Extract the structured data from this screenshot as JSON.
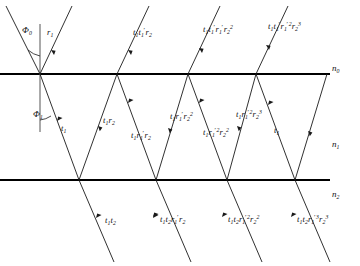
{
  "figure": {
    "width": 360,
    "height": 266,
    "background_color": "#ffffff",
    "line_color": "#1a1a1a",
    "interface_color": "#000000"
  },
  "angles": [
    {
      "name": "phi-0",
      "label_html": "&Phi;<sub>0</sub>",
      "text": "Φ₀",
      "x": 22,
      "y": 26,
      "meaning": "angle of incidence in medium n0"
    },
    {
      "name": "phi-1",
      "label_html": "&Phi;<sub>1</sub>",
      "text": "Φ₁",
      "x": 33,
      "y": 110,
      "meaning": "refraction angle in medium n1"
    }
  ],
  "media": [
    {
      "name": "n-0",
      "label_html": "n<sub>0</sub>",
      "text": "n₀",
      "x": 332,
      "y": 64,
      "meaning": "refractive index of upper medium"
    },
    {
      "name": "n-1",
      "label_html": "n<sub>1</sub>",
      "text": "n₁",
      "x": 332,
      "y": 140,
      "meaning": "refractive index of film"
    },
    {
      "name": "n-2",
      "label_html": "n<sub>2</sub>",
      "text": "n₂",
      "x": 332,
      "y": 190,
      "meaning": "refractive index of lower medium"
    }
  ],
  "interfaces": [
    {
      "name": "top-interface",
      "y": 74,
      "x1": 0,
      "x2": 330
    },
    {
      "name": "bottom-interface",
      "y": 180,
      "x1": 0,
      "x2": 330
    }
  ],
  "reflected_beams": [
    {
      "name": "reflected-beam-1",
      "label_html": "r<sub>1</sub>",
      "text": "r₁",
      "x": 47,
      "y": 28
    },
    {
      "name": "reflected-beam-2",
      "label_html": "t<sub>1</sub>t<sub>1</sub><span class=\"pr\">′</span>r<sub>2</sub>",
      "text": "t₁t₁′r₂",
      "x": 133,
      "y": 28
    },
    {
      "name": "reflected-beam-3",
      "label_html": "t<sub>1</sub>t<sub>1</sub><span class=\"pr\">′</span>r<sub>1</sub><span class=\"pr\">′</span>r<sub>2</sub><sup>2</sup>",
      "text": "t₁t₁′r₁′r₂²",
      "x": 203,
      "y": 25
    },
    {
      "name": "reflected-beam-4",
      "label_html": "t<sub>1</sub>t<sub>1</sub><span class=\"pr\">′</span>r<sub>1</sub><span class=\"pr\">′</span><sup>2</sup>r<sub>2</sub><sup>3</sup>",
      "text": "t₁t₁′r₁′²r₂³",
      "x": 268,
      "y": 22
    }
  ],
  "internal_beams": [
    {
      "name": "internal-beam-down-1",
      "label_html": "t<sub>1</sub>",
      "text": "t₁",
      "x": 61,
      "y": 124
    },
    {
      "name": "internal-beam-up-1",
      "label_html": "t<sub>1</sub>r<sub>2</sub>",
      "text": "t₁r₂",
      "x": 103,
      "y": 116
    },
    {
      "name": "internal-beam-down-2",
      "label_html": "t<sub>1</sub>r<sub>1</sub><span class=\"pr\">′</span>r<sub>2</sub>",
      "text": "t₁r₁′r₂",
      "x": 131,
      "y": 131
    },
    {
      "name": "internal-beam-up-2",
      "label_html": "t<sub>1</sub>r<sub>1</sub><span class=\"pr\">′</span>r<sub>2</sub><sup>2</sup>",
      "text": "t₁r₁′r₂²",
      "x": 170,
      "y": 112
    },
    {
      "name": "internal-beam-down-3",
      "label_html": "t<sub>1</sub>r<sub>1</sub><span class=\"pr\">′</span><sup>2</sup>r<sub>2</sub><sup>2</sup>",
      "text": "t₁r₁′²r₂²",
      "x": 203,
      "y": 128
    },
    {
      "name": "internal-beam-up-3",
      "label_html": "t<sub>1</sub>r<sub>1</sub><span class=\"pr\">′</span><sup>2</sup>r<sub>2</sub><sup>3</sup>",
      "text": "t₁r₁′²r₂³",
      "x": 236,
      "y": 110
    },
    {
      "name": "internal-beam-down-4",
      "label_html": "t<sub>1</sub>",
      "text": "t₁",
      "x": 274,
      "y": 126
    }
  ],
  "transmitted_beams": [
    {
      "name": "transmitted-beam-1",
      "label_html": "t<sub>1</sub>t<sub>2</sub>",
      "text": "t₁t₂",
      "x": 105,
      "y": 216
    },
    {
      "name": "transmitted-beam-2",
      "label_html": "t<sub>1</sub>t<sub>2</sub>r<sub>1</sub><span class=\"pr\">′</span>r<sub>2</sub>",
      "text": "t₁t₂r₁′r₂",
      "x": 160,
      "y": 215
    },
    {
      "name": "transmitted-beam-3",
      "label_html": "t<sub>1</sub>t<sub>2</sub>r<sub>1</sub><span class=\"pr\">′</span><sup>2</sup>r<sub>2</sub><sup>2</sup>",
      "text": "t₁t₂r₁′²r₂²",
      "x": 228,
      "y": 215
    },
    {
      "name": "transmitted-beam-4",
      "label_html": "t<sub>1</sub>t<sub>2</sub>r<sub>1</sub><span class=\"pr\">′</span><sup>3</sup>r<sub>2</sub><sup>3</sup>",
      "text": "t₁t₂r₁′³r₂³",
      "x": 297,
      "y": 215
    }
  ]
}
